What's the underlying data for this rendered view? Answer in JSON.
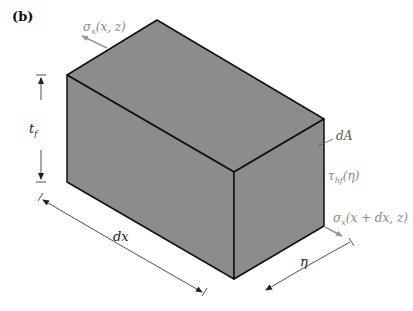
{
  "figure": {
    "panel_label": "(b)",
    "box_fill": "#8c8c8c",
    "edge_color": "#111111",
    "annotation_color": "#888888",
    "dimension_color": "#333333"
  },
  "labels": {
    "sigma_top": "σx(x, z)",
    "sigma_top_main": "σ",
    "sigma_top_sub": "x",
    "sigma_top_args": "(x, z)",
    "dA": "dA",
    "tau": "τhf(η)",
    "tau_main": "τ",
    "tau_sub": "hf",
    "tau_args": "(η)",
    "sigma_bottom": "σx(x + dx, z)",
    "sigma_bottom_main": "σ",
    "sigma_bottom_sub": "x",
    "sigma_bottom_args": "(x + dx, z)",
    "tf": "tf",
    "tf_main": "t",
    "tf_sub": "f",
    "dx": "dx",
    "eta": "η"
  }
}
